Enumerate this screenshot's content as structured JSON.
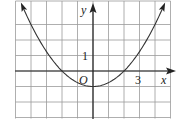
{
  "figure": {
    "type": "function-graph",
    "function": "y = x^2/4 - 1",
    "x_axis_label": "x",
    "y_axis_label": "y",
    "origin_label": "O",
    "x_tick_label": "3",
    "x_tick_value": 3,
    "y_tick_label": "1",
    "y_tick_value": 1,
    "x_range": [
      -5,
      5
    ],
    "y_range": [
      -3,
      4
    ],
    "grid": true,
    "vertex": [
      0,
      -1
    ],
    "x_intercepts": [
      -2,
      2
    ],
    "colors": {
      "grid": "#9a9a9a",
      "axis": "#222222",
      "curve": "#333333"
    }
  }
}
